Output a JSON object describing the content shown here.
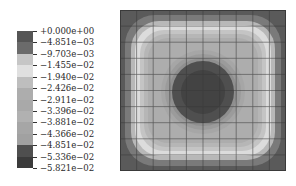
{
  "chart_data": {
    "type": "heatmap",
    "subtype": "filled-contour",
    "title": "",
    "xlabel": "",
    "ylabel": "",
    "legend_position": "left",
    "grid": true,
    "grid_divisions": [
      10,
      10
    ],
    "colorbar": {
      "labels": [
        "+0.000e+00",
        "−4.851e−03",
        "−9.703e−03",
        "−1.455e−02",
        "−1.940e−02",
        "−2.426e−02",
        "−2.911e−02",
        "−3.396e−02",
        "−3.881e−02",
        "−4.366e−02",
        "−4.851e−02",
        "−5.336e−02",
        "−5.821e−02"
      ],
      "values": [
        0.0,
        -0.004851,
        -0.009703,
        -0.01455,
        -0.0194,
        -0.02426,
        -0.02911,
        -0.03396,
        -0.03881,
        -0.04366,
        -0.04851,
        -0.05336,
        -0.05821
      ],
      "band_colors": [
        "#555555",
        "#6b6b6b",
        "#c6c6c6",
        "#e0e0e0",
        "#bebebe",
        "#adadad",
        "#a9a9a9",
        "#b1b1b1",
        "#a6a6a6",
        "#a1a1a1",
        "#4f4f4f",
        "#3b3b3b"
      ]
    },
    "field_description": "Square domain; near-zero values along edges (dark border), light rounded-square ring, mid-gray plateau, dark circular minimum at center",
    "range": [
      -0.05821,
      0.0
    ]
  }
}
